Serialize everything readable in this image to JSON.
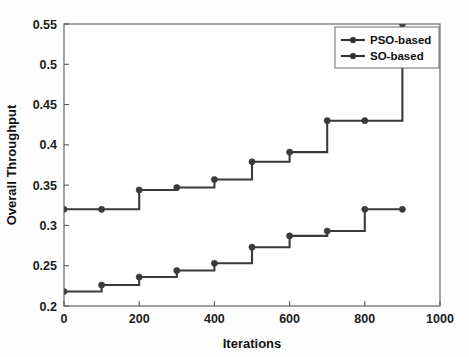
{
  "chart_data": {
    "type": "line",
    "title": "",
    "subtitle": "",
    "xlabel": "Iterations",
    "ylabel": "Overall Throughput",
    "xlim": [
      0,
      1000
    ],
    "ylim": [
      0.2,
      0.55
    ],
    "xticks": [
      0,
      200,
      400,
      600,
      800,
      1000
    ],
    "xtick_labels": [
      "0",
      "200",
      "400",
      "600",
      "800",
      "1000"
    ],
    "yticks": [
      0.2,
      0.25,
      0.3,
      0.35,
      0.4,
      0.45,
      0.5,
      0.55
    ],
    "ytick_labels": [
      "0.2",
      "0.25",
      "0.3",
      "0.35",
      "0.4",
      "0.45",
      "0.5",
      "0.55"
    ],
    "grid": false,
    "legend_position": "top-right",
    "drawstyle": "steps-post",
    "marker": "circle",
    "line_color": "#3a3a3a",
    "x": [
      0,
      100,
      200,
      300,
      400,
      500,
      600,
      700,
      800,
      900
    ],
    "series": [
      {
        "name": "PSO-based",
        "color": "#3a3a3a",
        "values": [
          0.32,
          0.32,
          0.344,
          0.347,
          0.357,
          0.379,
          0.391,
          0.43,
          0.43,
          0.55
        ]
      },
      {
        "name": "SO-based",
        "color": "#3a3a3a",
        "values": [
          0.218,
          0.226,
          0.236,
          0.244,
          0.253,
          0.273,
          0.287,
          0.293,
          0.32,
          0.32
        ]
      }
    ],
    "annotations": []
  },
  "legend": {
    "entries": [
      {
        "label": "PSO-based"
      },
      {
        "label": "SO-based"
      }
    ]
  },
  "axes": {
    "x_title": "Iterations",
    "y_title": "Overall Throughput"
  }
}
